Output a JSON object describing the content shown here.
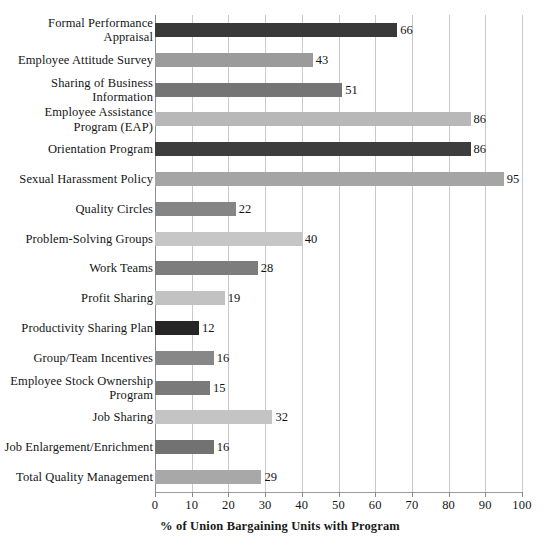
{
  "chart_data": {
    "type": "bar",
    "orientation": "horizontal",
    "title": "",
    "subtitle": "",
    "xlabel": "% of Union Bargaining Units with Program",
    "ylabel": "",
    "xlim": [
      0,
      100
    ],
    "xticks": [
      0,
      10,
      20,
      30,
      40,
      50,
      60,
      70,
      80,
      90,
      100
    ],
    "xtick_labels": [
      "0",
      "10",
      "20",
      "30",
      "40",
      "50",
      "60",
      "70",
      "80",
      "90",
      "100"
    ],
    "grid": "vertical",
    "legend": "none",
    "categories": [
      "Formal Performance Appraisal",
      "Employee Attitude Survey",
      "Sharing of Business Information",
      "Employee Assistance Program (EAP)",
      "Orientation Program",
      "Sexual Harassment Policy",
      "Quality Circles",
      "Problem-Solving Groups",
      "Work Teams",
      "Profit Sharing",
      "Productivity Sharing Plan",
      "Group/Team Incentives",
      "Employee Stock Ownership Program",
      "Job Sharing",
      "Job Enlargement/Enrichment",
      "Total Quality Management"
    ],
    "values": [
      66,
      43,
      51,
      86,
      86,
      95,
      22,
      40,
      28,
      19,
      12,
      16,
      15,
      32,
      16,
      29
    ],
    "bars": [
      {
        "label_lines": [
          "Formal Performance",
          "Appraisal"
        ],
        "value": 66,
        "value_text": "66",
        "color": "#393939"
      },
      {
        "label_lines": [
          "Employee Attitude Survey"
        ],
        "value": 43,
        "value_text": "43",
        "color": "#9b9b9b"
      },
      {
        "label_lines": [
          "Sharing of Business",
          "Information"
        ],
        "value": 51,
        "value_text": "51",
        "color": "#757575"
      },
      {
        "label_lines": [
          "Employee Assistance",
          "Program (EAP)"
        ],
        "value": 86,
        "value_text": "86",
        "color": "#b8b8b8"
      },
      {
        "label_lines": [
          "Orientation Program"
        ],
        "value": 86,
        "value_text": "86",
        "color": "#3d3d3d"
      },
      {
        "label_lines": [
          "Sexual Harassment Policy"
        ],
        "value": 95,
        "value_text": "95",
        "color": "#a5a5a5"
      },
      {
        "label_lines": [
          "Quality Circles"
        ],
        "value": 22,
        "value_text": "22",
        "color": "#858585"
      },
      {
        "label_lines": [
          "Problem-Solving Groups"
        ],
        "value": 40,
        "value_text": "40",
        "color": "#c6c6c6"
      },
      {
        "label_lines": [
          "Work Teams"
        ],
        "value": 28,
        "value_text": "28",
        "color": "#7d7d7d"
      },
      {
        "label_lines": [
          "Profit Sharing"
        ],
        "value": 19,
        "value_text": "19",
        "color": "#c2c2c2"
      },
      {
        "label_lines": [
          "Productivity Sharing Plan"
        ],
        "value": 12,
        "value_text": "12",
        "color": "#262626"
      },
      {
        "label_lines": [
          "Group/Team Incentives"
        ],
        "value": 16,
        "value_text": "16",
        "color": "#878787"
      },
      {
        "label_lines": [
          "Employee Stock Ownership",
          "Program"
        ],
        "value": 15,
        "value_text": "15",
        "color": "#7a7a7a"
      },
      {
        "label_lines": [
          "Job Sharing"
        ],
        "value": 32,
        "value_text": "32",
        "color": "#c4c4c4"
      },
      {
        "label_lines": [
          "Job Enlargement/Enrichment"
        ],
        "value": 16,
        "value_text": "16",
        "color": "#727272"
      },
      {
        "label_lines": [
          "Total Quality Management"
        ],
        "value": 29,
        "value_text": "29",
        "color": "#a8a8a8"
      }
    ]
  },
  "colors": {
    "background": "#ffffff",
    "gridline": "#c9c9c9",
    "axis": "#8f8f8f",
    "text": "#151515"
  }
}
